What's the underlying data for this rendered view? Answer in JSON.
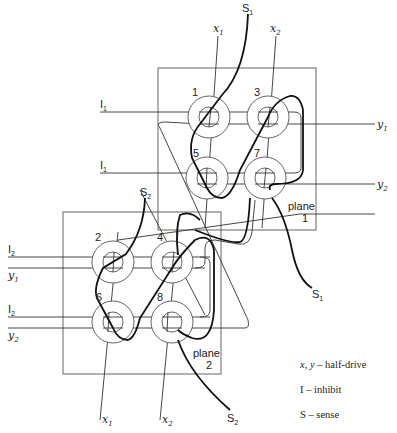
{
  "diagram": {
    "type": "core memory wiring diagram",
    "planes": [
      {
        "id": "plane-1",
        "label_line1": "plane",
        "label_line2": "1"
      },
      {
        "id": "plane-2",
        "label_line1": "plane",
        "label_line2": "2"
      }
    ],
    "cores": [
      {
        "number": "1",
        "plane": 1
      },
      {
        "number": "3",
        "plane": 1
      },
      {
        "number": "5",
        "plane": 1
      },
      {
        "number": "7",
        "plane": 1
      },
      {
        "number": "2",
        "plane": 2
      },
      {
        "number": "4",
        "plane": 2
      },
      {
        "number": "6",
        "plane": 2
      },
      {
        "number": "8",
        "plane": 2
      }
    ],
    "wire_labels": {
      "top_x1": {
        "base": "x",
        "sub": "1"
      },
      "top_x2": {
        "base": "x",
        "sub": "2"
      },
      "top_s1": {
        "base": "S",
        "sub": "1"
      },
      "p1_i1_top": {
        "base": "I",
        "sub": "1"
      },
      "p1_i1_bottom": {
        "base": "I",
        "sub": "1"
      },
      "p1_y1": {
        "base": "y",
        "sub": "1"
      },
      "p1_y2": {
        "base": "y",
        "sub": "2"
      },
      "p1_s1_out": {
        "base": "S",
        "sub": "1"
      },
      "p2_s2_top": {
        "base": "S",
        "sub": "2"
      },
      "p2_i2_top": {
        "base": "I",
        "sub": "2"
      },
      "p2_y1": {
        "base": "y",
        "sub": "1"
      },
      "p2_i2_bottom": {
        "base": "I",
        "sub": "2"
      },
      "p2_y2": {
        "base": "y",
        "sub": "2"
      },
      "bottom_x1": {
        "base": "x",
        "sub": "1"
      },
      "bottom_x2": {
        "base": "x",
        "sub": "2"
      },
      "bottom_s2": {
        "base": "S",
        "sub": "2"
      }
    }
  },
  "legend": {
    "items": [
      {
        "key": "x, y",
        "desc": "half-drive"
      },
      {
        "key": "I",
        "desc": "inhibit"
      },
      {
        "key": "S",
        "desc": "sense"
      }
    ],
    "separator": "–"
  },
  "colors": {
    "line": "#333333",
    "sense_wire": "#111111",
    "background": "#ffffff"
  }
}
